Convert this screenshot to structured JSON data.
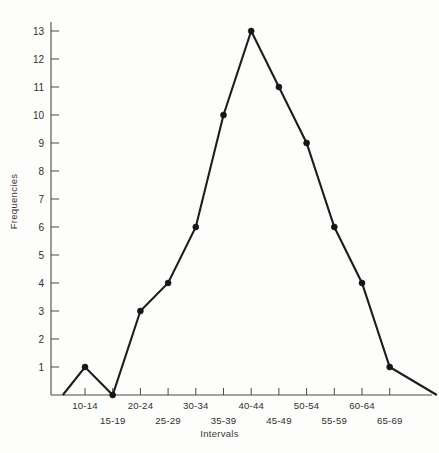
{
  "chart_data": {
    "type": "line",
    "title": "",
    "subtitle": "",
    "xlabel": "Intervals",
    "ylabel": "Frequencies",
    "categories": [
      "10-14",
      "15-19",
      "20-24",
      "25-29",
      "30-34",
      "35-39",
      "40-44",
      "45-49",
      "50-54",
      "55-59",
      "60-64",
      "65-69"
    ],
    "values": [
      1,
      0,
      3,
      4,
      6,
      10,
      13,
      11,
      9,
      6,
      4,
      1
    ],
    "closed_polygon": true,
    "leading_zero_anchor": 0,
    "trailing_zero_anchor": 0,
    "ylim": [
      0,
      13
    ],
    "yticks": [
      1,
      2,
      3,
      4,
      5,
      6,
      7,
      8,
      9,
      10,
      11,
      12,
      13
    ],
    "ytick_labels": [
      "1",
      "2",
      "3",
      "4",
      "5",
      "6",
      "7",
      "8",
      "9",
      "10",
      "11",
      "12",
      "13"
    ],
    "xtick_labels_upper_row": [
      "10-14",
      "20-24",
      "30-34",
      "40-44",
      "50-54",
      "60-64"
    ],
    "xtick_labels_lower_row": [
      "15-19",
      "25-29",
      "35-39",
      "45-49",
      "55-59",
      "65-69"
    ],
    "grid": false,
    "legend": false,
    "legend_position": "none",
    "markers": true,
    "series": [
      {
        "name": "Frequencies",
        "values": [
          1,
          0,
          3,
          4,
          6,
          10,
          13,
          11,
          9,
          6,
          4,
          1
        ]
      }
    ],
    "colors": {
      "line": "#1d1d1d",
      "marker": "#151515",
      "axis": "#4a4a4a",
      "background": "#fdfdfb",
      "text": "#2f2f2f"
    }
  }
}
